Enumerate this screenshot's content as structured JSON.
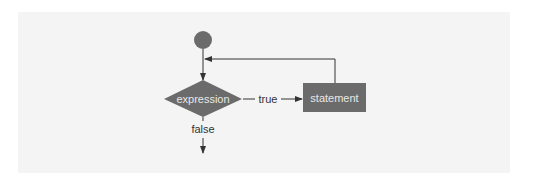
{
  "diagram": {
    "type": "flowchart",
    "colors": {
      "background_panel": "#f4f4f4",
      "shape_fill": "#6b6b6b",
      "shape_text": "#e8e8e8",
      "line": "#333333",
      "label_text": "#333333"
    },
    "nodes": [
      {
        "id": "start",
        "shape": "circle",
        "label": ""
      },
      {
        "id": "decision",
        "shape": "diamond",
        "label": "expression"
      },
      {
        "id": "body",
        "shape": "rectangle",
        "label": "statement"
      }
    ],
    "edges": [
      {
        "from": "start",
        "to": "decision",
        "label": ""
      },
      {
        "from": "decision",
        "to": "body",
        "label": "true"
      },
      {
        "from": "body",
        "to": "decision",
        "label": ""
      },
      {
        "from": "decision",
        "to": "exit",
        "label": "false"
      }
    ],
    "labels": {
      "decision": "expression",
      "body": "statement",
      "true_edge": "true",
      "false_edge": "false"
    }
  }
}
